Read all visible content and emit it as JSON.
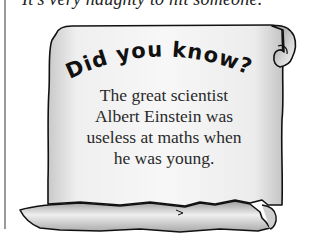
{
  "page": {
    "top_line": "It's very naughty to hit someone.",
    "callout": {
      "heading": "Did you know?",
      "heading_letters": [
        "D",
        "i",
        "d",
        " ",
        "y",
        "o",
        "u",
        " ",
        "k",
        "n",
        "o",
        "w",
        "?"
      ],
      "body_lines": [
        "The great scientist",
        "Albert Einstein was",
        "useless at maths when",
        "he was young."
      ]
    }
  },
  "colors": {
    "scroll_fill_light": "#f4f4f4",
    "scroll_fill_dark": "#bdbdbd",
    "outline": "#111111",
    "rule": "#9a9a9a"
  }
}
